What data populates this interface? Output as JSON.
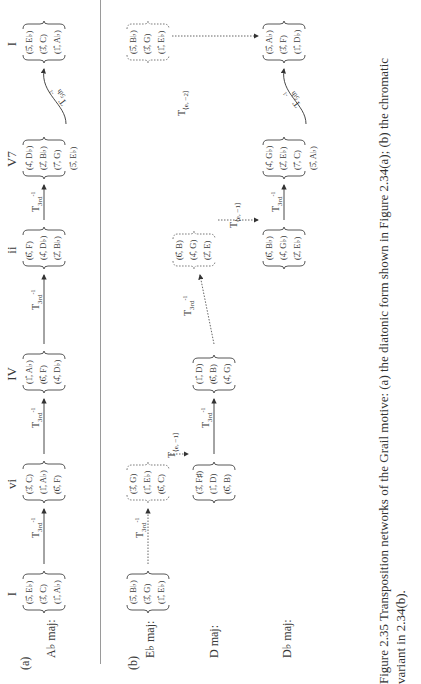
{
  "figure": {
    "panel_a_label": "(a)",
    "panel_b_label": "(b)",
    "numerals": [
      "I",
      "vi",
      "IV",
      "ii",
      "V7",
      "I"
    ],
    "rows": {
      "ab": {
        "label": "A♭ maj:"
      },
      "eb": {
        "label": "E♭ maj:"
      },
      "d": {
        "label": "D maj:"
      },
      "db": {
        "label": "D♭ maj:"
      }
    },
    "chords_a": [
      [
        "(5̂, E♭)",
        "(3̂, C)",
        "(1̂, A♭)"
      ],
      [
        "(3̂, C)",
        "(1̂, A♭)",
        "(6̂, F)"
      ],
      [
        "(1̂, A♭)",
        "(6̂, F)",
        "(4̂, D♭)"
      ],
      [
        "(6̂, F)",
        "(4̂, D♭)",
        "(2̂, B♭)"
      ],
      [
        "(4̂, D♭)",
        "(2̂, B♭)",
        "(7̂, G)",
        "(5̂, E♭)"
      ],
      [
        "(5̂, E♭)",
        "(3̂, C)",
        "(1̂, A♭)"
      ]
    ],
    "chords_b": {
      "eb_I": [
        "(5̂, B♭)",
        "(3̂, G)",
        "(1̂, E♭)"
      ],
      "eb_vi": [
        "(3̂, G)",
        "(1̂, E♭)",
        "(6̂, C)"
      ],
      "eb_I_end": [
        "(5̂, B♭)",
        "(3̂, G)",
        "(1̂, E♭)"
      ],
      "d_vi": [
        "(3̂, F♯)",
        "(1̂, D)",
        "(6̂, B)"
      ],
      "d_IV": [
        "(1̂, D)",
        "(6̂, B)",
        "(4̂, G)"
      ],
      "d_ii": [
        "(6̂, B)",
        "(4̂, G)",
        "(2̂, E)"
      ],
      "db_ii": [
        "(6̂, B♭)",
        "(4̂, G♭)",
        "(2̂, E♭)"
      ],
      "db_V7": [
        "(4̂, G♭)",
        "(2̂, E♭)",
        "(7̂, C)",
        "(5̂, A♭)"
      ],
      "db_I": [
        "(5̂, A♭)",
        "(3̂, F)",
        "(1̂, D♭)"
      ]
    },
    "transforms": {
      "t3rd_base": "T",
      "t3rd_sub": "3rd",
      "t3rd_sup": "-1",
      "t5th_sub": "5th",
      "t5th_sup": "-1",
      "te_minus1_base": "T",
      "te_minus1_sub": "⟨e, −1⟩",
      "te_minus2_sub": "⟨e, −2⟩"
    },
    "caption": {
      "line1": "Figure 2.35  Transposition networks of the Grail motive: (a) the diatonic form shown in Figure 2.34(a); (b) the chromatic",
      "line2": "variant in 2.34(b)."
    }
  }
}
